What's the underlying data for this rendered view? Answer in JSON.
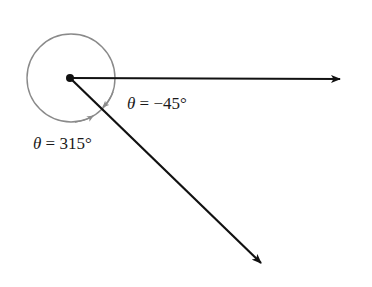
{
  "diagram": {
    "title": "",
    "origin": {
      "x": 70,
      "y": 78
    },
    "circle_radius": 44,
    "rays": [
      {
        "name": "initial-ray",
        "angle_deg": 0,
        "end": {
          "x": 340,
          "y": 79
        }
      },
      {
        "name": "terminal-ray",
        "angle_deg": -45,
        "end": {
          "x": 261,
          "y": 263
        }
      }
    ],
    "labels": {
      "negative_angle": {
        "symbol": "θ",
        "text": " = −45°"
      },
      "positive_angle": {
        "symbol": "θ",
        "text": " = 315°"
      }
    },
    "colors": {
      "ray": "#111111",
      "arc": "#8a8a8a",
      "text": "#1a1a1a"
    }
  }
}
